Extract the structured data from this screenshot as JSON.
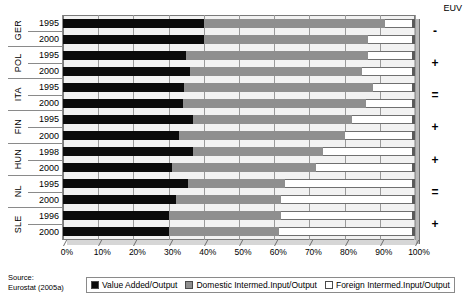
{
  "chart_data": {
    "type": "bar",
    "orientation": "horizontal",
    "stacked": true,
    "title": "",
    "xlabel": "",
    "ylabel": "",
    "xlim": [
      0,
      100
    ],
    "xtick_labels": [
      "0%",
      "10%",
      "20%",
      "30%",
      "40%",
      "50%",
      "60%",
      "70%",
      "80%",
      "90%",
      "100%"
    ],
    "xtick_values": [
      0,
      10,
      20,
      30,
      40,
      50,
      60,
      70,
      80,
      90,
      100
    ],
    "grid": true,
    "legend_position": "bottom",
    "series": [
      {
        "name": "Value Added/Output",
        "color": "#0b0b0b",
        "values": [
          40,
          40,
          35,
          36,
          34.5,
          34,
          37,
          33,
          37,
          31,
          35.5,
          32,
          30,
          30
        ]
      },
      {
        "name": "Domestic Intermed.Input/Output",
        "color": "#8f8f8f",
        "values": [
          51.5,
          46.6,
          51.6,
          49,
          53.5,
          52,
          45,
          47,
          37,
          41,
          27.5,
          30,
          32,
          31.5
        ]
      },
      {
        "name": "Foreign Intermed.Input/Output",
        "color": "#ffffff",
        "values": [
          8.5,
          13.4,
          13.4,
          15,
          12,
          14,
          18,
          20,
          26,
          28,
          37,
          38,
          38,
          38.5
        ]
      }
    ],
    "categories": [
      {
        "country": "GER",
        "year": "1995",
        "euv": "-"
      },
      {
        "country": "GER",
        "year": "2000",
        "euv": ""
      },
      {
        "country": "POL",
        "year": "1995",
        "euv": "+"
      },
      {
        "country": "POL",
        "year": "2000",
        "euv": ""
      },
      {
        "country": "ITA",
        "year": "1995",
        "euv": "="
      },
      {
        "country": "ITA",
        "year": "2000",
        "euv": ""
      },
      {
        "country": "FIN",
        "year": "1995",
        "euv": "+"
      },
      {
        "country": "FIN",
        "year": "2000",
        "euv": ""
      },
      {
        "country": "HUN",
        "year": "1998",
        "euv": "+"
      },
      {
        "country": "HUN",
        "year": "2000",
        "euv": ""
      },
      {
        "country": "NL",
        "year": "1995",
        "euv": "="
      },
      {
        "country": "NL",
        "year": "2000",
        "euv": ""
      },
      {
        "country": "SLE",
        "year": "1996",
        "euv": "+"
      },
      {
        "country": "SLE",
        "year": "2000",
        "euv": ""
      }
    ],
    "groups": [
      {
        "country": "GER",
        "years": [
          "1995",
          "2000"
        ],
        "euv": "-"
      },
      {
        "country": "POL",
        "years": [
          "1995",
          "2000"
        ],
        "euv": "+"
      },
      {
        "country": "ITA",
        "years": [
          "1995",
          "2000"
        ],
        "euv": "="
      },
      {
        "country": "FIN",
        "years": [
          "1995",
          "2000"
        ],
        "euv": "+"
      },
      {
        "country": "HUN",
        "years": [
          "1998",
          "2000"
        ],
        "euv": "+"
      },
      {
        "country": "NL",
        "years": [
          "1995",
          "2000"
        ],
        "euv": "="
      },
      {
        "country": "SLE",
        "years": [
          "1996",
          "2000"
        ],
        "euv": "+"
      }
    ]
  },
  "header": {
    "euv_label": "EUV"
  },
  "source": {
    "line1": "Source:",
    "line2": "Eurostat (2005a)"
  },
  "legend": {
    "items": [
      {
        "label": "Value Added/Output",
        "swatch": "va"
      },
      {
        "label": "Domestic Intermed.Input/Output",
        "swatch": "dom"
      },
      {
        "label": "Foreign Intermed.Input/Output",
        "swatch": "for"
      }
    ]
  }
}
